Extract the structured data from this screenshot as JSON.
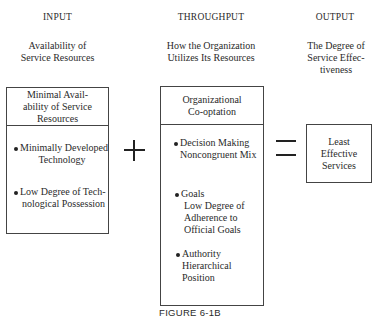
{
  "columns": {
    "input": {
      "header": "INPUT",
      "subtitle": [
        "Availability of",
        "Service Resources"
      ],
      "box_title": [
        "Minimal Avail-",
        "ability of Service",
        "Resources"
      ],
      "items": [
        [
          "Minimally Developed",
          "Technology"
        ],
        [
          "Low Degree of Tech-",
          "nological Possession"
        ]
      ]
    },
    "throughput": {
      "header": "THROUGHPUT",
      "subtitle": [
        "How the Organization",
        "Utilizes Its Resources"
      ],
      "box_title": [
        "Organizational",
        "Co-optation"
      ],
      "items": [
        [
          "Decision Making",
          "Noncongruent Mix"
        ],
        [
          "Goals",
          "Low Degree of",
          "Adherence to",
          "Official Goals"
        ],
        [
          "Authority",
          "Hierarchical",
          "Position"
        ]
      ]
    },
    "output": {
      "header": "OUTPUT",
      "subtitle": [
        "The Degree of",
        "Service Effec-",
        "tiveness"
      ],
      "box_text": [
        "Least",
        "Effective",
        "Services"
      ]
    }
  },
  "operators": {
    "plus": "plus-sign",
    "equals": "equals-sign"
  },
  "caption": "FIGURE 6-1B"
}
